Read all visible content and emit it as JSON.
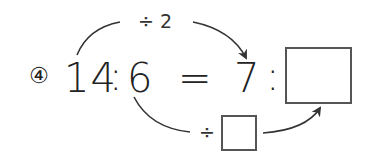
{
  "problem": {
    "number_label": "④",
    "left_ratio": {
      "a": "14",
      "sep": ":",
      "b": "6"
    },
    "equals": "=",
    "right_ratio": {
      "a": "7",
      "sep": ":",
      "b_blank": ""
    }
  },
  "top_operation": {
    "label": "÷ 2"
  },
  "bottom_operation": {
    "operator": "÷",
    "blank": ""
  },
  "colors": {
    "stroke": "#333333",
    "box_border": "#555555",
    "text": "#222222"
  }
}
